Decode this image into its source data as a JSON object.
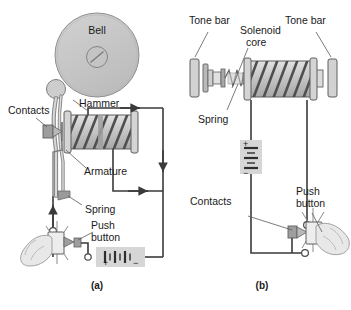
{
  "figure": {
    "background_color": "#ffffff",
    "ink_color": "#3a3a3a",
    "fill_gray": "#c9c9c9",
    "fill_light": "#dcdcdc",
    "fill_dark": "#9a9a9a"
  },
  "panel_a": {
    "caption": "(a)",
    "bell_label": "Bell",
    "labels": {
      "contacts": "Contacts",
      "hammer": "Hammer",
      "armature": "Armature",
      "spring": "Spring",
      "push_button_line1": "Push",
      "push_button_line2": "button"
    },
    "battery": {
      "plus": "+",
      "minus": "−"
    }
  },
  "panel_b": {
    "caption": "(b)",
    "labels": {
      "tone_bar_left": "Tone bar",
      "tone_bar_right": "Tone bar",
      "solenoid_line1": "Solenoid",
      "solenoid_line2": "core",
      "spring": "Spring",
      "contacts": "Contacts",
      "push_button_line1": "Push",
      "push_button_line2": "button"
    },
    "battery": {
      "plus": "+",
      "minus": "−"
    }
  }
}
